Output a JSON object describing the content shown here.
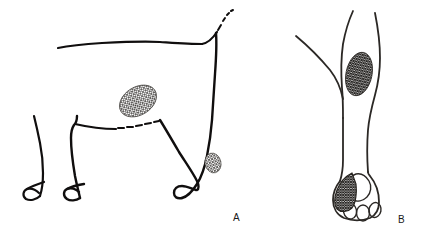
{
  "figure": {
    "background_color": "#ffffff",
    "ink_color": "#100e0e",
    "type": "line-drawing-illustration",
    "panels": [
      {
        "id": "A",
        "label": "A",
        "label_x": 233,
        "label_y": 221,
        "view": "lateral view of dog standing",
        "subject": "dog",
        "shaded_regions": [
          {
            "name": "flank-patch",
            "pattern": "cross-hatch",
            "shape": "ellipse",
            "cx": 138,
            "cy": 101,
            "rx": 20,
            "ry": 14,
            "rotation_deg": -32,
            "density": "medium"
          },
          {
            "name": "hock-patch",
            "pattern": "cross-hatch",
            "shape": "ellipse",
            "cx": 213,
            "cy": 163,
            "rx": 8,
            "ry": 10,
            "rotation_deg": -14,
            "density": "medium"
          }
        ]
      },
      {
        "id": "B",
        "label": "B",
        "label_x": 398,
        "label_y": 223,
        "view": "frontal view of distal limb and paw",
        "subject": "dog limb",
        "shaded_regions": [
          {
            "name": "carpus-patch",
            "pattern": "cross-hatch",
            "shape": "ellipse",
            "cx": 359,
            "cy": 74,
            "rx": 13,
            "ry": 22,
            "rotation_deg": 12,
            "density": "dense"
          },
          {
            "name": "medial-digit-patch",
            "pattern": "cross-hatch",
            "shape": "digit",
            "cx": 344,
            "cy": 192,
            "density": "dense"
          }
        ],
        "paw_features": [
          {
            "name": "metacarpal-pad"
          },
          {
            "name": "digital-pad-1"
          },
          {
            "name": "digital-pad-2"
          },
          {
            "name": "digital-pad-3"
          }
        ]
      }
    ]
  }
}
